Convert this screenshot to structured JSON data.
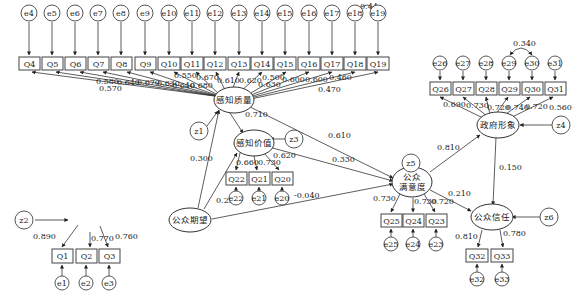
{
  "diagram": {
    "type": "structural-equation-model",
    "latent_variables": {
      "perceived_quality": "感知质量",
      "perceived_value": "感知价值",
      "public_expectation": "公众期望",
      "public_satisfaction_line1": "公众",
      "public_satisfaction_line2": "满意度",
      "government_image": "政府形象",
      "public_trust": "公众信任"
    },
    "disturbances": {
      "z1": "z1",
      "z2": "z2",
      "z3": "z3",
      "z4": "z4",
      "z5": "z5",
      "z6": "z6"
    },
    "pq_items": [
      {
        "q": "Q4",
        "e": "e4",
        "loading": "0.570"
      },
      {
        "q": "Q5",
        "e": "e5",
        "loading": "0.580"
      },
      {
        "q": "Q6",
        "e": "e6",
        "loading": "0.640"
      },
      {
        "q": "Q7",
        "e": "e7",
        "loading": "0.670"
      },
      {
        "q": "Q8",
        "e": "e8",
        "loading": "0.630"
      },
      {
        "q": "Q9",
        "e": "e9",
        "loading": "0.640"
      },
      {
        "q": "Q10",
        "e": "e10",
        "loading": "0.680"
      },
      {
        "q": "Q11",
        "e": "e11",
        "loading": "0.550"
      },
      {
        "q": "Q12",
        "e": "e12",
        "loading": "0.670"
      },
      {
        "q": "Q13",
        "e": "e13",
        "loading": "0.610"
      },
      {
        "q": "Q14",
        "e": "e14",
        "loading": "0.620"
      },
      {
        "q": "Q15",
        "e": "e15",
        "loading": "0.500"
      },
      {
        "q": "Q16",
        "e": "e16",
        "loading": "0.630"
      },
      {
        "q": "Q17",
        "e": "e17",
        "loading": "0.600"
      },
      {
        "q": "Q18",
        "e": "e18",
        "loading": "0.600"
      },
      {
        "q": "Q19",
        "e": "e19",
        "loading": "0.460"
      }
    ],
    "pq_extra_label": "0.470",
    "e18_e19_covariance": "0.44",
    "pv_items": [
      {
        "q": "Q22",
        "e": "e22",
        "loading": "0.660"
      },
      {
        "q": "Q21",
        "e": "e21",
        "loading": "0.730"
      },
      {
        "q": "Q20",
        "e": "e20",
        "loading": "0.620"
      }
    ],
    "pe_items": [
      {
        "q": "Q1",
        "e": "e1",
        "loading": "0.890"
      },
      {
        "q": "Q2",
        "e": "e2",
        "loading": "0.770"
      },
      {
        "q": "Q3",
        "e": "e3",
        "loading": "0.760"
      }
    ],
    "ps_items": [
      {
        "q": "Q25",
        "e": "e25",
        "loading": "0.730"
      },
      {
        "q": "Q24",
        "e": "e24",
        "loading": "0.730"
      },
      {
        "q": "Q23",
        "e": "e23",
        "loading": "0.720"
      }
    ],
    "gi_items": [
      {
        "q": "Q26",
        "e": "e26",
        "loading": "0.690"
      },
      {
        "q": "Q27",
        "e": "e27",
        "loading": "0.730"
      },
      {
        "q": "Q28",
        "e": "e28",
        "loading": "0.720"
      },
      {
        "q": "Q29",
        "e": "e29",
        "loading": "0.740"
      },
      {
        "q": "Q30",
        "e": "e30",
        "loading": "0.720"
      },
      {
        "q": "Q31",
        "e": "e31",
        "loading": "0.560"
      }
    ],
    "e29_e30_covariance": "0.340",
    "pt_items": [
      {
        "q": "Q32",
        "e": "e32",
        "loading": "0.810"
      },
      {
        "q": "Q33",
        "e": "e33",
        "loading": "0.780"
      }
    ],
    "paths": {
      "pq_to_pv": "0.710",
      "pq_to_ps": "0.610",
      "pv_to_ps": "0.330",
      "pe_to_pq": "0.300",
      "pe_to_pv": "0.220",
      "pe_to_ps": "-0.040",
      "ps_to_gi": "0.810",
      "ps_to_pt": "0.210",
      "gi_to_pt": "0.150"
    }
  }
}
